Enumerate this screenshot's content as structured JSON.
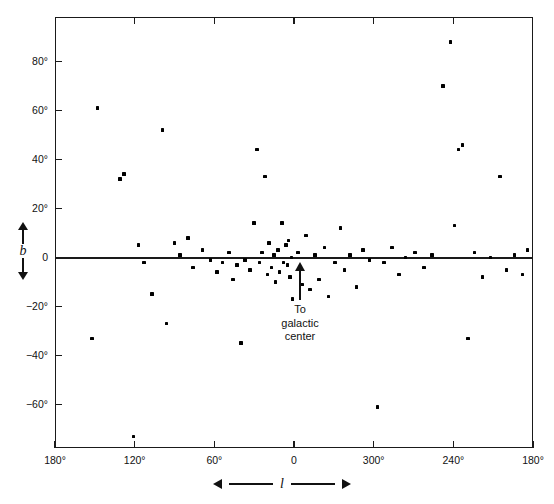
{
  "chart_data": {
    "type": "scatter",
    "title": "",
    "xlabel": "l",
    "ylabel": "b",
    "xlim": [
      180,
      -180
    ],
    "ylim": [
      -78,
      92
    ],
    "grid": false,
    "legend": null,
    "x_tick_labels": [
      "180°",
      "120°",
      "60°",
      "0",
      "300°",
      "240°",
      "180°"
    ],
    "x_tick_values": [
      180,
      120,
      60,
      0,
      -60,
      -120,
      -180
    ],
    "y_tick_labels": [
      "80°",
      "60°",
      "40°",
      "20°",
      "0",
      "−20°",
      "−40°",
      "−60°"
    ],
    "y_tick_values": [
      80,
      60,
      40,
      20,
      0,
      -20,
      -40,
      -60
    ],
    "annotations": [
      {
        "text": "To galactic center",
        "x": 0,
        "y": 0,
        "direction": "up"
      }
    ],
    "baseline_y": 0,
    "points": [
      {
        "l": 148,
        "b": 61
      },
      {
        "l": 152,
        "b": -33
      },
      {
        "l": 131,
        "b": 32
      },
      {
        "l": 128,
        "b": 34
      },
      {
        "l": 121,
        "b": -73
      },
      {
        "l": 117,
        "b": 5
      },
      {
        "l": 113,
        "b": -2
      },
      {
        "l": 107,
        "b": -15
      },
      {
        "l": 99,
        "b": 52
      },
      {
        "l": 96,
        "b": -27
      },
      {
        "l": 90,
        "b": 6
      },
      {
        "l": 86,
        "b": 1
      },
      {
        "l": 80,
        "b": 8
      },
      {
        "l": 76,
        "b": -4
      },
      {
        "l": 69,
        "b": 3
      },
      {
        "l": 63,
        "b": -1
      },
      {
        "l": 58,
        "b": -6
      },
      {
        "l": 54,
        "b": -2
      },
      {
        "l": 49,
        "b": 2
      },
      {
        "l": 46,
        "b": -9
      },
      {
        "l": 43,
        "b": -3
      },
      {
        "l": 40,
        "b": -35
      },
      {
        "l": 37,
        "b": -1
      },
      {
        "l": 33,
        "b": -5
      },
      {
        "l": 30,
        "b": 14
      },
      {
        "l": 28,
        "b": 44
      },
      {
        "l": 26,
        "b": -2
      },
      {
        "l": 24,
        "b": 2
      },
      {
        "l": 22,
        "b": 33
      },
      {
        "l": 20,
        "b": -7
      },
      {
        "l": 19,
        "b": 6
      },
      {
        "l": 17,
        "b": -4
      },
      {
        "l": 15,
        "b": 1
      },
      {
        "l": 14,
        "b": -10
      },
      {
        "l": 12,
        "b": 3
      },
      {
        "l": 11,
        "b": -6
      },
      {
        "l": 9,
        "b": 14
      },
      {
        "l": 8,
        "b": -2
      },
      {
        "l": 6,
        "b": 5
      },
      {
        "l": 5,
        "b": -3
      },
      {
        "l": 4,
        "b": 7
      },
      {
        "l": 3,
        "b": -8
      },
      {
        "l": 2,
        "b": 0
      },
      {
        "l": 1,
        "b": -17
      },
      {
        "l": -3,
        "b": 2
      },
      {
        "l": -6,
        "b": -11
      },
      {
        "l": -9,
        "b": 9
      },
      {
        "l": -12,
        "b": -13
      },
      {
        "l": -16,
        "b": 1
      },
      {
        "l": -19,
        "b": -9
      },
      {
        "l": -23,
        "b": 4
      },
      {
        "l": -26,
        "b": -16
      },
      {
        "l": -31,
        "b": -2
      },
      {
        "l": -35,
        "b": 12
      },
      {
        "l": -38,
        "b": -5
      },
      {
        "l": -42,
        "b": 1
      },
      {
        "l": -47,
        "b": -12
      },
      {
        "l": -52,
        "b": 3
      },
      {
        "l": -57,
        "b": -1
      },
      {
        "l": -63,
        "b": -61
      },
      {
        "l": -68,
        "b": -2
      },
      {
        "l": -74,
        "b": 4
      },
      {
        "l": -79,
        "b": -7
      },
      {
        "l": -84,
        "b": 0
      },
      {
        "l": -91,
        "b": 2
      },
      {
        "l": -98,
        "b": -4
      },
      {
        "l": -104,
        "b": 1
      },
      {
        "l": -112,
        "b": 70
      },
      {
        "l": -118,
        "b": 88
      },
      {
        "l": -121,
        "b": 13
      },
      {
        "l": -124,
        "b": 44
      },
      {
        "l": -127,
        "b": 46
      },
      {
        "l": -131,
        "b": -33
      },
      {
        "l": -136,
        "b": 2
      },
      {
        "l": -142,
        "b": -8
      },
      {
        "l": -148,
        "b": 0
      },
      {
        "l": -155,
        "b": 33
      },
      {
        "l": -160,
        "b": -5
      },
      {
        "l": -166,
        "b": 1
      },
      {
        "l": -172,
        "b": -7
      },
      {
        "l": -176,
        "b": 3
      }
    ]
  },
  "axis_labels": {
    "b_symbol": "b",
    "l_symbol": "l"
  },
  "annotation": {
    "line1": "To",
    "line2": "galactic",
    "line3": "center"
  },
  "colors": {
    "axis": "#1a1a1a",
    "point": "#000000",
    "background": "#ffffff"
  }
}
